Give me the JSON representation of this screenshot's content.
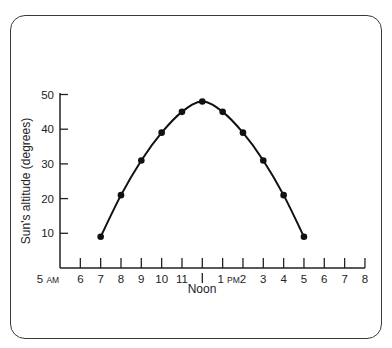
{
  "chart_data": {
    "type": "line",
    "title": "",
    "xlabel": "Noon",
    "ylabel": "Sun's altitude (degrees)",
    "x_ticks": [
      "5 AM",
      "6",
      "7",
      "8",
      "9",
      "10",
      "11",
      "Noon",
      "1 PM",
      "2",
      "3",
      "4",
      "5",
      "6",
      "7",
      "8"
    ],
    "y_ticks": [
      10,
      20,
      30,
      40,
      50
    ],
    "ylim": [
      0,
      50
    ],
    "grid": false,
    "legend": null,
    "series": [
      {
        "name": "Sun's altitude",
        "x": [
          "7 AM",
          "8 AM",
          "9 AM",
          "10 AM",
          "11 AM",
          "Noon",
          "1 PM",
          "2 PM",
          "3 PM",
          "4 PM",
          "5 PM"
        ],
        "x_hours": [
          7,
          8,
          9,
          10,
          11,
          12,
          13,
          14,
          15,
          16,
          17
        ],
        "values": [
          9,
          21,
          31,
          39,
          45,
          48,
          45,
          39,
          31,
          21,
          9
        ]
      }
    ]
  },
  "labels": {
    "y_axis_title": "Sun's altitude (degrees)",
    "noon_label": "Noon",
    "am_suffix": "AM",
    "pm_suffix": "PM"
  },
  "colors": {
    "line": "#111111",
    "axis": "#222222",
    "frame": "#3a3a3a"
  }
}
